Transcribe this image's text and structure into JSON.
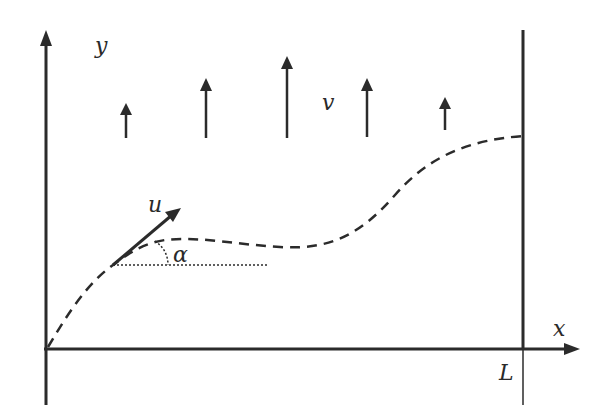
{
  "diagram": {
    "colors": {
      "background": "#ffffff",
      "stroke": "#2b2b2b"
    },
    "labels": {
      "y_axis": "y",
      "x_axis": "x",
      "velocity_field": "v",
      "tangent_vector": "u",
      "angle": "α",
      "length": "L"
    },
    "elements": {
      "y_axis": {
        "from": [
          46,
          405
        ],
        "to": [
          46,
          32
        ]
      },
      "x_axis": {
        "from": [
          46,
          349
        ],
        "to": [
          578,
          349
        ]
      },
      "boundary_line": {
        "x": 523,
        "from_y": 30,
        "to_y": 405
      },
      "field_arrows": [
        {
          "x": 126,
          "base": 138,
          "tip": 104
        },
        {
          "x": 206,
          "base": 138,
          "tip": 79
        },
        {
          "x": 287,
          "base": 138,
          "tip": 57
        },
        {
          "x": 367,
          "base": 137,
          "tip": 79
        },
        {
          "x": 445,
          "base": 130,
          "tip": 97
        }
      ],
      "trajectory": "dashed curve from origin rising, flattening near alpha, then S-curve up to boundary L",
      "tangent_arrow": {
        "from": [
          113,
          265
        ],
        "to": [
          178,
          210
        ]
      },
      "reference_line": {
        "from": [
          113,
          265
        ],
        "to": [
          268,
          265
        ],
        "style": "dotted"
      }
    }
  }
}
